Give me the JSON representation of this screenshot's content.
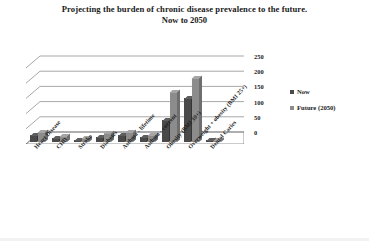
{
  "chart_data": {
    "type": "bar",
    "title": "Projecting the burden of chronic disease prevalence to the future.",
    "subtitle": "Now to 2050",
    "xlabel": "",
    "ylabel": "Prevalence (millions)",
    "ylim": [
      0,
      250
    ],
    "yticks": [
      0,
      50,
      100,
      150,
      200,
      250
    ],
    "grid": true,
    "legend_position": "right",
    "style": "3d-column-grayscale",
    "categories": [
      "Heart Disease",
      "CHD",
      "Stroke",
      "Diabetes",
      "Asthma - lifetime",
      "Asthma - current",
      "Obesity (BMI 30+)",
      "Overweight + obesity (BMI 25+)",
      "Dental Caries"
    ],
    "series": [
      {
        "name": "Now",
        "color": "#4a4a4a",
        "values": [
          24,
          14,
          7,
          18,
          24,
          16,
          72,
          145,
          5
        ]
      },
      {
        "name": "Future (2050)",
        "color": "#8c8c8c",
        "values": [
          33,
          20,
          12,
          30,
          33,
          22,
          165,
          210,
          6
        ]
      }
    ]
  },
  "legend": {
    "items": [
      {
        "label": "Now",
        "color": "#4a4a4a"
      },
      {
        "label": "Future (2050)",
        "color": "#8c8c8c"
      }
    ]
  }
}
